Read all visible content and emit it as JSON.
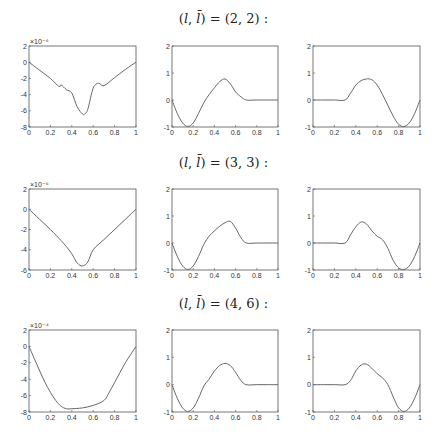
{
  "figure": {
    "rows": [
      {
        "title_prefix": "(",
        "title_l": "l",
        "title_sep": ", ",
        "title_lbar": "l̄",
        "title_suffix": ") = (2, 2) :"
      },
      {
        "title_prefix": "(",
        "title_l": "l",
        "title_sep": ", ",
        "title_lbar": "l̄",
        "title_suffix": ") = (3, 3) :"
      },
      {
        "title_prefix": "(",
        "title_l": "l",
        "title_sep": ", ",
        "title_lbar": "l̄",
        "title_suffix": ") = (4, 6) :"
      }
    ]
  },
  "chart_data": [
    {
      "type": "line",
      "row": 1,
      "col": 1,
      "title": "(l, l̄) = (2, 2)",
      "exponent_label": "×10⁻⁶",
      "xlim": [
        0,
        1
      ],
      "ylim": [
        -8,
        2
      ],
      "xticks": [
        "0",
        "0.2",
        "0.4",
        "0.6",
        "0.8",
        "1"
      ],
      "yticks": [
        "2",
        "0",
        "-2",
        "-4",
        "-6",
        "-8"
      ],
      "x": [
        0,
        0.1,
        0.2,
        0.28,
        0.3,
        0.35,
        0.4,
        0.45,
        0.5,
        0.52,
        0.55,
        0.6,
        0.65,
        0.7,
        0.8,
        0.9,
        1.0
      ],
      "y": [
        0,
        -1,
        -2,
        -3,
        -2.8,
        -3.4,
        -3.8,
        -5.5,
        -6.4,
        -6.4,
        -5.8,
        -3.2,
        -2.6,
        -2.9,
        -1.9,
        -0.9,
        0
      ]
    },
    {
      "type": "line",
      "row": 1,
      "col": 2,
      "xlim": [
        0,
        1
      ],
      "ylim": [
        -1,
        2
      ],
      "xticks": [
        "0",
        "0.2",
        "0.4",
        "0.6",
        "0.8",
        "1"
      ],
      "yticks": [
        "2",
        "1",
        "0",
        "-1"
      ],
      "x": [
        0,
        0.05,
        0.1,
        0.15,
        0.2,
        0.25,
        0.3,
        0.35,
        0.4,
        0.45,
        0.5,
        0.55,
        0.6,
        0.65,
        0.7,
        0.8,
        0.9,
        1.0
      ],
      "y": [
        0,
        -0.5,
        -0.85,
        -0.98,
        -0.85,
        -0.5,
        -0.1,
        0.2,
        0.45,
        0.68,
        0.78,
        0.6,
        0.3,
        0.12,
        0,
        0,
        0,
        0
      ]
    },
    {
      "type": "line",
      "row": 1,
      "col": 3,
      "xlim": [
        0,
        1
      ],
      "ylim": [
        -1,
        2
      ],
      "xticks": [
        "0",
        "0.2",
        "0.4",
        "0.6",
        "0.8",
        "1"
      ],
      "yticks": [
        "2",
        "1",
        "0",
        "-1"
      ],
      "x": [
        0,
        0.1,
        0.2,
        0.3,
        0.35,
        0.4,
        0.45,
        0.5,
        0.55,
        0.6,
        0.65,
        0.7,
        0.75,
        0.8,
        0.85,
        0.9,
        0.95,
        1.0
      ],
      "y": [
        0,
        0,
        0,
        0,
        0.25,
        0.55,
        0.72,
        0.78,
        0.75,
        0.55,
        0.2,
        -0.2,
        -0.6,
        -0.9,
        -0.98,
        -0.85,
        -0.5,
        0
      ]
    },
    {
      "type": "line",
      "row": 2,
      "col": 1,
      "title": "(l, l̄) = (3, 3)",
      "exponent_label": "×10⁻⁶",
      "xlim": [
        0,
        1
      ],
      "ylim": [
        -6,
        2
      ],
      "xticks": [
        "0",
        "0.2",
        "0.4",
        "0.6",
        "0.8",
        "1"
      ],
      "yticks": [
        "2",
        "0",
        "-2",
        "-4",
        "-6"
      ],
      "x": [
        0,
        0.1,
        0.2,
        0.3,
        0.35,
        0.4,
        0.45,
        0.5,
        0.55,
        0.6,
        0.7,
        0.8,
        0.9,
        1.0
      ],
      "y": [
        0,
        -1,
        -2,
        -3.1,
        -3.7,
        -4.4,
        -5.3,
        -5.6,
        -5.2,
        -4,
        -3,
        -2,
        -1,
        0
      ]
    },
    {
      "type": "line",
      "row": 2,
      "col": 2,
      "xlim": [
        0,
        1
      ],
      "ylim": [
        -1,
        2
      ],
      "xticks": [
        "0",
        "0.2",
        "0.4",
        "0.6",
        "0.8",
        "1"
      ],
      "yticks": [
        "2",
        "1",
        "0",
        "-1"
      ],
      "x": [
        0,
        0.05,
        0.1,
        0.15,
        0.2,
        0.25,
        0.3,
        0.35,
        0.4,
        0.45,
        0.5,
        0.55,
        0.6,
        0.65,
        0.7,
        0.8,
        0.9,
        1.0
      ],
      "y": [
        0,
        -0.5,
        -0.85,
        -0.98,
        -0.85,
        -0.5,
        -0.05,
        0.25,
        0.45,
        0.62,
        0.75,
        0.8,
        0.55,
        0.2,
        0,
        0,
        0,
        0
      ]
    },
    {
      "type": "line",
      "row": 2,
      "col": 3,
      "xlim": [
        0,
        1
      ],
      "ylim": [
        -1,
        2
      ],
      "xticks": [
        "0",
        "0.2",
        "0.4",
        "0.6",
        "0.8",
        "1"
      ],
      "yticks": [
        "2",
        "1",
        "0",
        "-1"
      ],
      "x": [
        0,
        0.1,
        0.2,
        0.3,
        0.35,
        0.4,
        0.45,
        0.5,
        0.55,
        0.6,
        0.65,
        0.7,
        0.75,
        0.8,
        0.85,
        0.9,
        0.95,
        1.0
      ],
      "y": [
        0,
        0,
        0,
        0,
        0.3,
        0.6,
        0.78,
        0.7,
        0.45,
        0.25,
        0.12,
        -0.2,
        -0.65,
        -0.92,
        -0.98,
        -0.85,
        -0.5,
        0
      ]
    },
    {
      "type": "line",
      "row": 3,
      "col": 1,
      "title": "(l, l̄) = (4, 6)",
      "exponent_label": "×10⁻⁴",
      "xlim": [
        0,
        1
      ],
      "ylim": [
        -8,
        2
      ],
      "xticks": [
        "0",
        "0.2",
        "0.4",
        "0.6",
        "0.8",
        "1"
      ],
      "yticks": [
        "2",
        "0",
        "-2",
        "-4",
        "-6",
        "-8"
      ],
      "x": [
        0,
        0.05,
        0.1,
        0.15,
        0.2,
        0.25,
        0.3,
        0.35,
        0.4,
        0.5,
        0.6,
        0.7,
        0.75,
        0.8,
        0.85,
        0.9,
        0.95,
        1.0
      ],
      "y": [
        0,
        -1.5,
        -3,
        -4.4,
        -5.6,
        -6.6,
        -7.3,
        -7.6,
        -7.6,
        -7.5,
        -7.2,
        -6.6,
        -5.6,
        -4.4,
        -3.2,
        -2,
        -1,
        0
      ]
    },
    {
      "type": "line",
      "row": 3,
      "col": 2,
      "xlim": [
        0,
        1
      ],
      "ylim": [
        -1,
        2
      ],
      "xticks": [
        "0",
        "0.2",
        "0.4",
        "0.6",
        "0.8",
        "1"
      ],
      "yticks": [
        "2",
        "1",
        "0",
        "-1"
      ],
      "x": [
        0,
        0.05,
        0.1,
        0.15,
        0.2,
        0.25,
        0.3,
        0.35,
        0.4,
        0.45,
        0.5,
        0.55,
        0.6,
        0.65,
        0.7,
        0.8,
        0.9,
        1.0
      ],
      "y": [
        0,
        -0.5,
        -0.85,
        -0.98,
        -0.85,
        -0.5,
        -0.05,
        0.2,
        0.5,
        0.7,
        0.78,
        0.7,
        0.45,
        0.15,
        0,
        0,
        0,
        0
      ]
    },
    {
      "type": "line",
      "row": 3,
      "col": 3,
      "xlim": [
        0,
        1
      ],
      "ylim": [
        -1,
        2
      ],
      "xticks": [
        "0",
        "0.2",
        "0.4",
        "0.6",
        "0.8",
        "1"
      ],
      "yticks": [
        "2",
        "1",
        "0",
        "-1"
      ],
      "x": [
        0,
        0.1,
        0.2,
        0.3,
        0.35,
        0.4,
        0.45,
        0.5,
        0.55,
        0.6,
        0.65,
        0.7,
        0.75,
        0.8,
        0.85,
        0.9,
        0.95,
        1.0
      ],
      "y": [
        0,
        0,
        0,
        0,
        0.15,
        0.5,
        0.72,
        0.75,
        0.6,
        0.4,
        0.25,
        0,
        -0.45,
        -0.85,
        -0.98,
        -0.85,
        -0.5,
        0
      ]
    }
  ]
}
